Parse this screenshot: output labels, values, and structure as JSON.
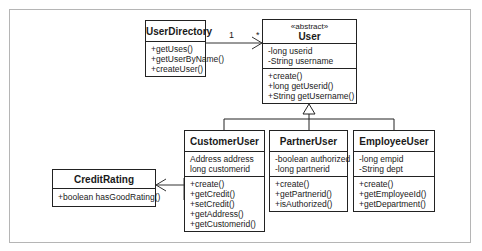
{
  "diagram": {
    "type": "UML class diagram",
    "classes": {
      "user_directory": {
        "name": "UserDirectory",
        "attributes": [],
        "operations": [
          "+getUses()",
          "+getUserByName()",
          "+createUser()"
        ]
      },
      "user": {
        "stereotype": "«abstract»",
        "name": "User",
        "attributes": [
          "-long userid",
          "-String username"
        ],
        "operations": [
          "+create()",
          "+long getUserid()",
          "+String getUsername()"
        ]
      },
      "credit_rating": {
        "name": "CreditRating",
        "attributes": [],
        "operations": [
          "+boolean hasGoodRating()"
        ]
      },
      "customer_user": {
        "name": "CustomerUser",
        "attributes": [
          "Address address",
          "long customerid"
        ],
        "operations": [
          "+create()",
          "+getCredit()",
          "+setCredit()",
          "+getAddress()",
          "+getCustomerid()"
        ]
      },
      "partner_user": {
        "name": "PartnerUser",
        "attributes": [
          "-boolean authorized",
          "-long partnerid"
        ],
        "operations": [
          "+create()",
          "+getPartnerid()",
          "+isAuthorized()"
        ]
      },
      "employee_user": {
        "name": "EmployeeUser",
        "attributes": [
          "-long empid",
          "-String dept"
        ],
        "operations": [
          "+create()",
          "+getEmployeeId()",
          "+getDepartment()"
        ]
      }
    },
    "relationships": {
      "directory_to_user": {
        "type": "association",
        "source_multiplicity": "1",
        "target_multiplicity": "*"
      },
      "generalization": {
        "type": "inheritance",
        "parent": "User",
        "children": [
          "CustomerUser",
          "PartnerUser",
          "EmployeeUser"
        ]
      },
      "customer_to_credit": {
        "type": "association",
        "from": "CustomerUser",
        "to": "CreditRating"
      }
    }
  }
}
